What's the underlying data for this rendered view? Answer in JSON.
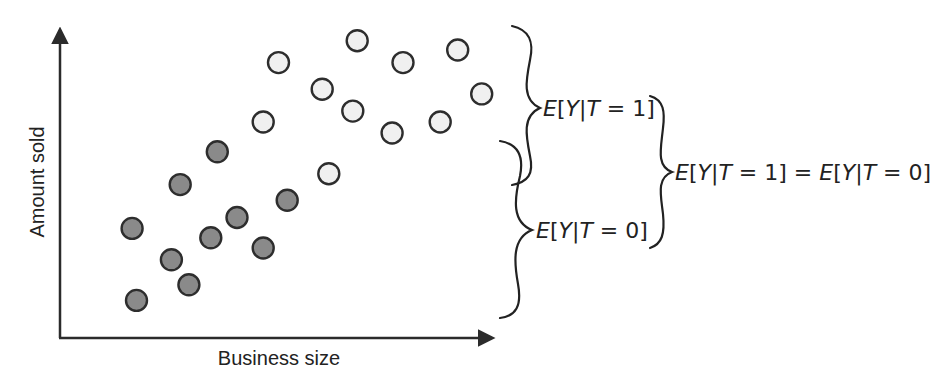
{
  "chart_data": {
    "type": "scatter",
    "title": "",
    "xlabel": "Business size",
    "ylabel": "Amount sold",
    "xlim": [
      0,
      10
    ],
    "ylim": [
      0,
      10
    ],
    "grid": false,
    "axis_ticks": false,
    "series": [
      {
        "name": "T = 1 (treated)",
        "color": "#f0f0f0",
        "points": [
          {
            "x": 5.0,
            "y": 8.8
          },
          {
            "x": 6.8,
            "y": 9.5
          },
          {
            "x": 7.85,
            "y": 8.8
          },
          {
            "x": 9.1,
            "y": 9.2
          },
          {
            "x": 6.0,
            "y": 7.95
          },
          {
            "x": 6.7,
            "y": 7.25
          },
          {
            "x": 9.65,
            "y": 7.8
          },
          {
            "x": 4.65,
            "y": 6.9
          },
          {
            "x": 7.6,
            "y": 6.55
          },
          {
            "x": 8.7,
            "y": 6.9
          },
          {
            "x": 6.15,
            "y": 5.25
          }
        ]
      },
      {
        "name": "T = 0 (untreated)",
        "color": "#8a8a8a",
        "points": [
          {
            "x": 3.6,
            "y": 5.95
          },
          {
            "x": 2.75,
            "y": 4.9
          },
          {
            "x": 1.65,
            "y": 3.5
          },
          {
            "x": 4.05,
            "y": 3.85
          },
          {
            "x": 3.45,
            "y": 3.2
          },
          {
            "x": 5.2,
            "y": 4.4
          },
          {
            "x": 4.65,
            "y": 2.875
          },
          {
            "x": 2.55,
            "y": 2.5
          },
          {
            "x": 2.95,
            "y": 1.7
          },
          {
            "x": 1.75,
            "y": 1.2
          }
        ]
      }
    ],
    "annotations": [
      {
        "type": "brace",
        "spans": "upper group (T=1)",
        "label": "E[Y|T = 1]"
      },
      {
        "type": "brace",
        "spans": "lower group (T=0)",
        "label": "E[Y|T = 0]"
      },
      {
        "type": "brace",
        "spans": "both labels",
        "label": "E[Y|T = 1] = E[Y|T = 0]"
      }
    ]
  },
  "labels": {
    "x_axis": "Business size",
    "y_axis": "Amount sold",
    "upper_brace": {
      "E": "E",
      "open": "[",
      "Y": "Y",
      "bar": "|",
      "T": "T",
      "rest": " = 1]"
    },
    "lower_brace": {
      "E": "E",
      "open": "[",
      "Y": "Y",
      "bar": "|",
      "T": "T",
      "rest": " = 0]"
    },
    "combined": {
      "E1": "E",
      "open1": "[",
      "Y1": "Y",
      "bar1": "|",
      "T1": "T",
      "rest1": " = 1] = ",
      "E2": "E",
      "open2": "[",
      "Y2": "Y",
      "bar2": "|",
      "T2": "T",
      "rest2": " = 0]"
    }
  },
  "colors": {
    "axis": "#2b2b2b",
    "treated_fill": "#f0f0f0",
    "untreated_fill": "#8a8a8a",
    "stroke": "#2d2d2d"
  }
}
